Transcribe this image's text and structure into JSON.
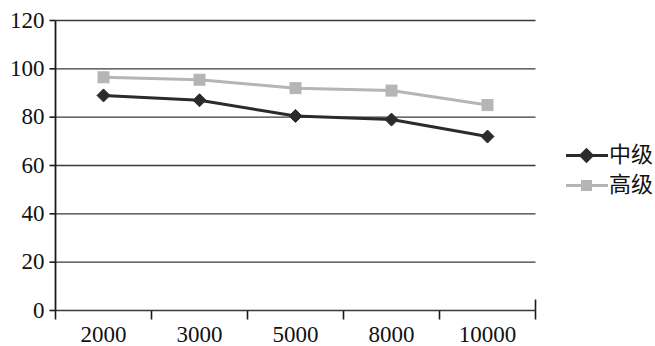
{
  "chart_data": {
    "type": "line",
    "title": "",
    "subtitle": "",
    "xlabel": "",
    "ylabel": "",
    "categories": [
      "2000",
      "3000",
      "5000",
      "8000",
      "10000"
    ],
    "series": [
      {
        "name": "中级",
        "color": "#2b2b2b",
        "marker": "diamond",
        "values": [
          89,
          87,
          80.5,
          79,
          72
        ]
      },
      {
        "name": "高级",
        "color": "#b5b5b5",
        "marker": "square",
        "values": [
          96.5,
          95.5,
          92,
          91,
          85
        ]
      }
    ],
    "ylim": [
      0,
      120
    ],
    "yticks": [
      0,
      20,
      40,
      60,
      80,
      100,
      120
    ],
    "ytick_labels": [
      "0",
      "20",
      "40",
      "60",
      "80",
      "100",
      "120"
    ],
    "xtick_labels": [
      "2000",
      "3000",
      "5000",
      "8000",
      "10000"
    ],
    "grid": "horizontal",
    "legend_position": "right",
    "legend_entries": [
      "中级",
      "高级"
    ],
    "axis_color": "#1a1a1a",
    "grid_color": "#3a3a3a",
    "background": "#ffffff"
  },
  "legend": {
    "items": [
      {
        "label": "中级"
      },
      {
        "label": "高级"
      }
    ]
  }
}
